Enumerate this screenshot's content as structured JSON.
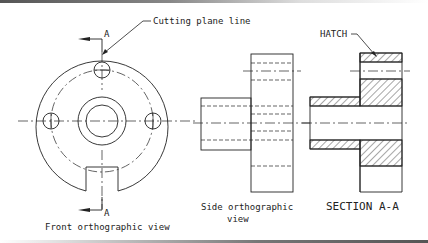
{
  "labels": {
    "cutting_plane": "Cutting plane line",
    "section_marker_top": "A",
    "section_marker_bottom": "A",
    "hatch": "HATCH",
    "front_view": "Front orthographic view",
    "side_view_line1": "Side orthographic",
    "side_view_line2": "view",
    "section_view": "SECTION A-A"
  },
  "colors": {
    "line": "#222222",
    "background": "#ffffff"
  }
}
